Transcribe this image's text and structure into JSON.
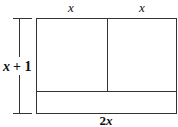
{
  "diagram": {
    "type": "area-model-rectangle",
    "labels": {
      "top_left": "x",
      "top_right": "x",
      "left_side": "x + 1",
      "left_side_var": "x",
      "left_side_rest": "+ 1",
      "bottom": "2x",
      "bottom_coef": "2",
      "bottom_var": "x"
    },
    "regions": [
      {
        "name": "left-square",
        "width": "x",
        "height": "x"
      },
      {
        "name": "right-square",
        "width": "x",
        "height": "x"
      },
      {
        "name": "bottom-strip",
        "width": "2x",
        "height": "1"
      }
    ],
    "colors": {
      "stroke": "#333333",
      "fill": "#ffffff",
      "text": "#111111"
    }
  }
}
